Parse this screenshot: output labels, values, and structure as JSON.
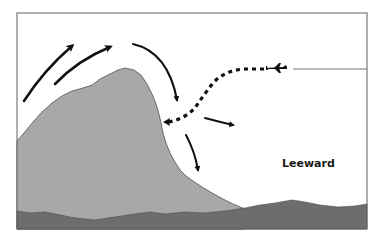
{
  "diagram": {
    "labels": {
      "leeward": "Leeward"
    },
    "colors": {
      "background": "#ffffff",
      "frame": "#7a7a7a",
      "mountain": "#a8a8a8",
      "mountain_outline": "#555555",
      "ground": "#6d6d6d",
      "arrows": "#111111"
    },
    "elements": {
      "windward_airflow_arrows": 2,
      "summit_downdraft_arrow": 1,
      "leeside_rotor_arrows": 2,
      "aircraft_flight_path": "dotted",
      "aircraft_icon": "airplane-icon"
    }
  }
}
